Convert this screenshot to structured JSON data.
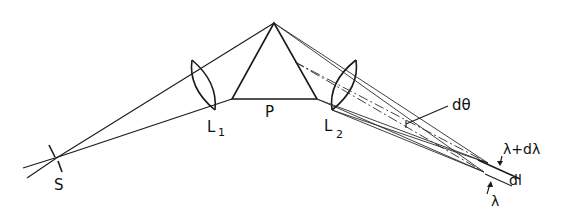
{
  "diagram": {
    "labels": {
      "source": "S",
      "lens1_main": "L",
      "lens1_sub": "1",
      "prism": "P",
      "lens2_main": "L",
      "lens2_sub": "2",
      "angle": "dθ",
      "wavelength_plus": "λ+dλ",
      "length": "dl",
      "wavelength": "λ"
    },
    "colors": {
      "stroke": "#1a1a1a",
      "background": "#ffffff"
    }
  }
}
